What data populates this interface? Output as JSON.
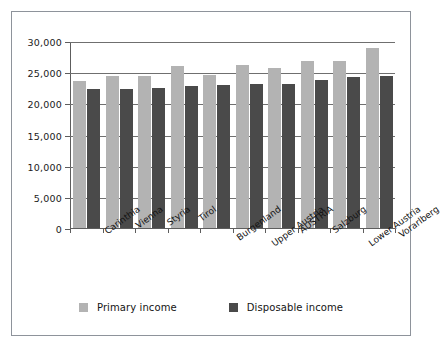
{
  "chart_data": {
    "type": "bar",
    "title": "",
    "xlabel": "",
    "ylabel": "",
    "ylim": [
      0,
      30000
    ],
    "yticks": [
      "0",
      "5,000",
      "10,000",
      "15,000",
      "20,000",
      "25,000",
      "30,000"
    ],
    "ytick_values": [
      0,
      5000,
      10000,
      15000,
      20000,
      25000,
      30000
    ],
    "grid": true,
    "legend_position": "bottom",
    "categories": [
      "Carinthia",
      "Vienna",
      "Styria",
      "Tirol",
      "Burgenland",
      "Upper Austria",
      "AUSTRIA",
      "Salzburg",
      "Lower Austria",
      "Vorarlberg"
    ],
    "series": [
      {
        "name": "Primary income",
        "color": "#b3b3b3",
        "values": [
          23600,
          24450,
          24400,
          26000,
          24500,
          26200,
          25600,
          26750,
          26850,
          28900
        ]
      },
      {
        "name": "Disposable income",
        "color": "#4a4a4a",
        "values": [
          22250,
          22300,
          22500,
          22750,
          23000,
          23100,
          23100,
          23750,
          24150,
          24350
        ]
      }
    ]
  },
  "legend": {
    "entries": [
      {
        "label": "Primary income"
      },
      {
        "label": "Disposable income"
      }
    ]
  }
}
